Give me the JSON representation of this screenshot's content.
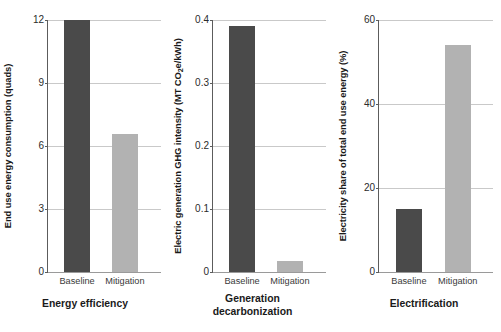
{
  "figure": {
    "background": "#ffffff",
    "bar_colors": {
      "baseline": "#4a4a4a",
      "mitigation": "#b2b2b2"
    },
    "grid_color": "#c9c9c9",
    "axis_color": "#5c5c5c"
  },
  "chart_data": [
    {
      "type": "bar",
      "title": "Energy efficiency",
      "title_line2": "",
      "xlabel": "",
      "ylabel": "End use energy consumption (quads)",
      "categories": [
        "Baseline",
        "Mitigation"
      ],
      "values": [
        12.0,
        6.55
      ],
      "series": [
        {
          "name": "End use energy consumption",
          "values": [
            12.0,
            6.55
          ]
        }
      ],
      "ylim": [
        0,
        12
      ],
      "yticks": [
        0,
        3,
        6,
        9,
        12
      ],
      "ytick_labels": [
        "0",
        "3",
        "6",
        "9",
        "12"
      ],
      "grid": true,
      "legend": "none",
      "legend_position": "none"
    },
    {
      "type": "bar",
      "title": "Generation",
      "title_line2": "decarbonization",
      "xlabel": "",
      "ylabel": "Electric generation GHG intensity (MT CO2e/kWh)",
      "ylabel_prefix": "Electric generation GHG intensity (MT CO",
      "ylabel_sub": "2",
      "ylabel_suffix": "e/kWh)",
      "categories": [
        "Baseline",
        "Mitigation"
      ],
      "values": [
        0.39,
        0.018
      ],
      "series": [
        {
          "name": "Electric generation GHG intensity",
          "values": [
            0.39,
            0.018
          ]
        }
      ],
      "ylim": [
        0,
        0.4
      ],
      "yticks": [
        0,
        0.1,
        0.2,
        0.3,
        0.4
      ],
      "ytick_labels": [
        "0",
        "0.1",
        "0.2",
        "0.3",
        "0.4"
      ],
      "grid": true,
      "legend": "none",
      "legend_position": "none"
    },
    {
      "type": "bar",
      "title": "Electrification",
      "title_line2": "",
      "xlabel": "",
      "ylabel": "Electricity share of total end use energy (%)",
      "categories": [
        "Baseline",
        "Mitigation"
      ],
      "values": [
        15.0,
        54.0
      ],
      "series": [
        {
          "name": "Electricity share of total end use energy",
          "values": [
            15.0,
            54.0
          ]
        }
      ],
      "ylim": [
        0,
        60
      ],
      "yticks": [
        0,
        20,
        40,
        60
      ],
      "ytick_labels": [
        "0",
        "20",
        "40",
        "60"
      ],
      "grid": true,
      "legend": "none",
      "legend_position": "none"
    }
  ]
}
